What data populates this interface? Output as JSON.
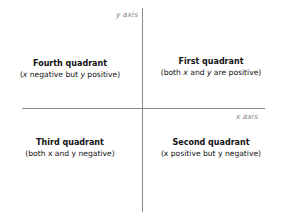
{
  "axes": {
    "y_label": "y axis",
    "x_label": "x axis",
    "color": "#8a8a8a"
  },
  "quadrants": {
    "fourth": {
      "title": "Fourth quadrant",
      "desc_parts": [
        "(",
        "x",
        " negative but ",
        "y",
        " positive)"
      ]
    },
    "first": {
      "title": "First quadrant",
      "desc_parts": [
        "(both ",
        "x",
        " and ",
        "y",
        " are positive)"
      ]
    },
    "third": {
      "title": "Third quadrant",
      "desc": "(both x and y negative)"
    },
    "second": {
      "title": "Second quadrant",
      "desc": "(x positive but y negative)"
    }
  }
}
